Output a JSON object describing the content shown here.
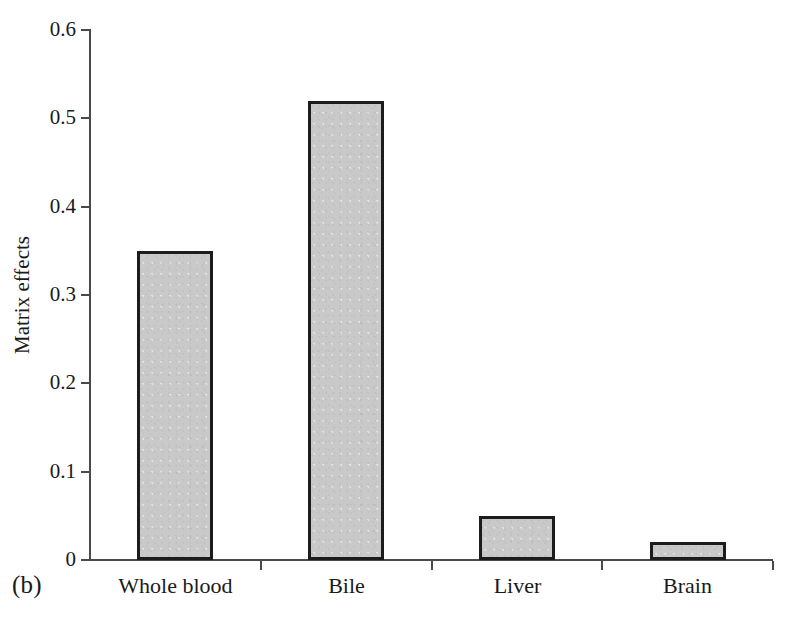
{
  "figure": {
    "panel_label": "(b)"
  },
  "chart_data": {
    "type": "bar",
    "title": "",
    "xlabel": "",
    "ylabel": "Matrix effects",
    "categories": [
      "Whole blood",
      "Bile",
      "Liver",
      "Brain"
    ],
    "values": [
      0.35,
      0.52,
      0.05,
      0.02
    ],
    "series": [
      {
        "name": "Matrix effects",
        "values": [
          0.35,
          0.52,
          0.05,
          0.02
        ]
      }
    ],
    "ylim": [
      0,
      0.6
    ],
    "yticks": [
      0,
      0.1,
      0.2,
      0.3,
      0.4,
      0.5,
      0.6
    ],
    "ytick_labels": [
      "0",
      "0.1",
      "0.2",
      "0.3",
      "0.4",
      "0.5",
      "0.6"
    ],
    "grid": false,
    "legend": "none",
    "bar_fill_color": "#c9c9c9",
    "bar_edge_color": "#1c1c1c",
    "axis_color": "#4a4a4a"
  }
}
